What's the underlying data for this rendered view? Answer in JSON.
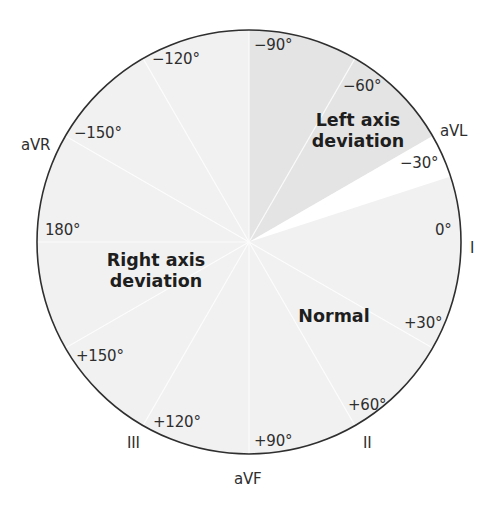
{
  "diagram": {
    "colors": {
      "circle_fill": "#f1f1f1",
      "left_axis_fill": "#e6e6e6",
      "gap_fill": "#ffffff",
      "outline": "#2f2f2f",
      "text": "#2e2e2e"
    },
    "regions": {
      "left_axis": {
        "line1": "Left axis",
        "line2": "deviation",
        "from_deg": -90,
        "to_deg": -30
      },
      "right_axis": {
        "line1": "Right axis",
        "line2": "deviation",
        "from_deg": 90,
        "to_deg": 180
      },
      "normal": {
        "label": "Normal",
        "from_deg": -30,
        "to_deg": 90
      }
    },
    "angle_labels": {
      "neg90": "−90°",
      "neg60": "−60°",
      "neg30": "−30°",
      "zero": "0°",
      "pos30": "+30°",
      "pos60": "+60°",
      "pos90": "+90°",
      "pos120": "+120°",
      "pos150": "+150°",
      "deg180": "180°",
      "neg150": "−150°",
      "neg120": "−120°"
    },
    "leads": {
      "I": "I",
      "II": "II",
      "III": "III",
      "aVR": "aVR",
      "aVL": "aVL",
      "aVF": "aVF"
    }
  }
}
